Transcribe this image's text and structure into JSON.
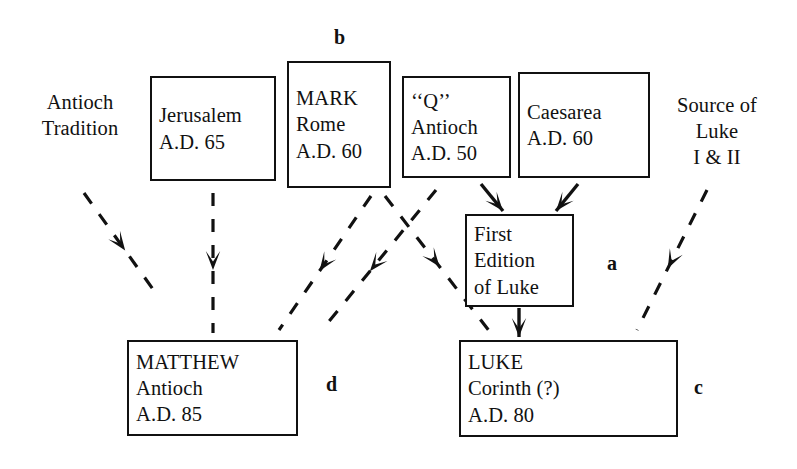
{
  "diagram": {
    "background": "#ffffff",
    "ink": "#111111",
    "nodes": [
      {
        "id": "antioch-tradition",
        "name": "antioch-tradition-text",
        "boxed": false,
        "align": "center",
        "lines": [
          "Antioch",
          "Tradition"
        ],
        "x": 14,
        "y": 84,
        "w": 132,
        "h": 62
      },
      {
        "id": "jerusalem",
        "name": "jerusalem-box",
        "boxed": true,
        "align": "left",
        "lines": [
          "Jerusalem",
          "A.D. 65"
        ],
        "x": 150,
        "y": 76,
        "w": 126,
        "h": 105
      },
      {
        "id": "mark",
        "name": "mark-box",
        "boxed": true,
        "align": "left",
        "lines": [
          "MARK",
          "Rome",
          "A.D. 60"
        ],
        "x": 287,
        "y": 61,
        "w": 104,
        "h": 127
      },
      {
        "id": "q",
        "name": "q-box",
        "boxed": true,
        "align": "left",
        "lines": [
          "‘‘Q’’",
          "Antioch",
          "A.D. 50"
        ],
        "x": 402,
        "y": 76,
        "w": 109,
        "h": 102
      },
      {
        "id": "caesarea",
        "name": "caesarea-box",
        "boxed": true,
        "align": "left",
        "lines": [
          "Caesarea",
          "A.D. 60"
        ],
        "x": 518,
        "y": 72,
        "w": 132,
        "h": 106
      },
      {
        "id": "source-of-luke",
        "name": "source-of-luke-text",
        "boxed": false,
        "align": "center",
        "lines": [
          "Source of",
          "Luke",
          "I & II"
        ],
        "x": 652,
        "y": 84,
        "w": 130,
        "h": 94
      },
      {
        "id": "first-edition",
        "name": "first-edition-of-luke-box",
        "boxed": true,
        "align": "left",
        "lines": [
          "First",
          "Edition",
          "of Luke"
        ],
        "x": 465,
        "y": 214,
        "w": 109,
        "h": 93
      },
      {
        "id": "matthew",
        "name": "matthew-box",
        "boxed": true,
        "align": "left",
        "lines": [
          "MATTHEW",
          "Antioch",
          "A.D. 85"
        ],
        "x": 127,
        "y": 340,
        "w": 171,
        "h": 96
      },
      {
        "id": "luke",
        "name": "luke-box",
        "boxed": true,
        "align": "left",
        "lines": [
          "LUKE",
          "Corinth (?)",
          "A.D. 80"
        ],
        "x": 459,
        "y": 340,
        "w": 219,
        "h": 97
      }
    ],
    "labels": [
      {
        "id": "b",
        "name": "callout-label-b",
        "text": "b",
        "x": 334,
        "y": 26
      },
      {
        "id": "a",
        "name": "callout-label-a",
        "text": "a",
        "x": 607,
        "y": 252
      },
      {
        "id": "d",
        "name": "callout-label-d",
        "text": "d",
        "x": 326,
        "y": 373
      },
      {
        "id": "c",
        "name": "callout-label-c",
        "text": "c",
        "x": 694,
        "y": 376
      }
    ],
    "edges": [
      {
        "id": "e1",
        "name": "edge-antioch-tradition-to-matthew",
        "from": "antioch-tradition",
        "to": "matthew",
        "style": "dashed",
        "path": "M 84,193 L 155,292",
        "head_t": 0.58
      },
      {
        "id": "e2",
        "name": "edge-jerusalem-to-matthew",
        "from": "jerusalem",
        "to": "matthew",
        "style": "dashed",
        "path": "M 213,193 L 213,333",
        "head_t": 0.55
      },
      {
        "id": "e3",
        "name": "edge-mark-to-matthew",
        "from": "mark",
        "to": "matthew",
        "style": "dashed",
        "path": "M 371,196 L 279,330",
        "head_t": 0.56
      },
      {
        "id": "e4",
        "name": "edge-q-to-matthew",
        "from": "q",
        "to": "matthew",
        "style": "dashed",
        "path": "M 436,190 L 322,330",
        "head_t": 0.58
      },
      {
        "id": "e5",
        "name": "edge-mark-to-luke",
        "from": "mark",
        "to": "luke",
        "style": "dashed",
        "path": "M 385,196 L 490,332",
        "head_t": 0.52
      },
      {
        "id": "e6",
        "name": "edge-q-to-first-edition",
        "from": "q",
        "to": "first-edition",
        "style": "solid",
        "path": "M 481,184 L 503,211",
        "head_t": 1.0
      },
      {
        "id": "e7",
        "name": "edge-caesarea-to-first-edition",
        "from": "caesarea",
        "to": "first-edition",
        "style": "solid",
        "path": "M 578,184 L 556,211",
        "head_t": 1.0
      },
      {
        "id": "e8",
        "name": "edge-first-edition-to-luke",
        "from": "first-edition",
        "to": "luke",
        "style": "solid",
        "path": "M 519,308 L 519,337",
        "head_t": 1.0
      },
      {
        "id": "e9",
        "name": "edge-source-of-luke-to-luke",
        "from": "source-of-luke",
        "to": "luke",
        "style": "dashed",
        "path": "M 707,190 L 637,330",
        "head_t": 0.56
      }
    ]
  }
}
